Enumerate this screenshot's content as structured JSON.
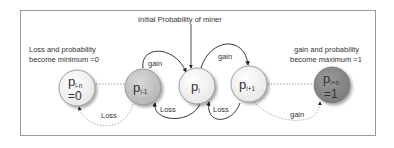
{
  "title": "Initial Probability  of miner",
  "annotations": {
    "left": [
      "Loss and probability",
      "become minimum =0"
    ],
    "right": [
      "gain and probability",
      "become maximum =1"
    ]
  },
  "nodes": [
    {
      "id": "p_i-n",
      "base": "p",
      "sub": "i-n",
      "value": "=0",
      "fill": "#ffffff"
    },
    {
      "id": "p_i-1",
      "base": "p",
      "sub": "i-1",
      "value": "",
      "fill": "#c8c8c8"
    },
    {
      "id": "p_i",
      "base": "p",
      "sub": "i",
      "value": "",
      "fill": "#ffffff"
    },
    {
      "id": "p_i+1",
      "base": "p",
      "sub": "i+1",
      "value": "",
      "fill": "#ffffff"
    },
    {
      "id": "p_i+n",
      "base": "p",
      "sub": "i+n",
      "value": "=1",
      "fill": "#8c8c8c"
    }
  ],
  "edges": {
    "gain_left": "gain",
    "gain_right": "gain",
    "loss_left": "Loss",
    "loss_right": "Loss",
    "loss_bottom": "Loss",
    "gain_bottom": "gain"
  }
}
